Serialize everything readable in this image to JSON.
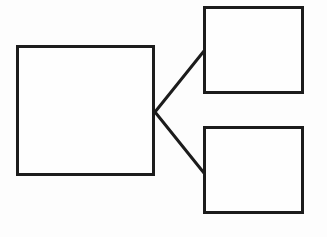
{
  "diagram": {
    "type": "tree",
    "stroke_color": "#1c1c1c",
    "background_color": "#ffffff",
    "nodes": [
      {
        "id": "root",
        "label": "",
        "x": 16,
        "y": 45,
        "width": 139,
        "height": 131
      },
      {
        "id": "child-top",
        "label": "",
        "x": 203,
        "y": 6,
        "width": 101,
        "height": 88
      },
      {
        "id": "child-bottom",
        "label": "",
        "x": 203,
        "y": 126,
        "width": 101,
        "height": 88
      }
    ],
    "edges": [
      {
        "from": "root",
        "to": "child-top",
        "x1": 155,
        "y1": 112,
        "x2": 204,
        "y2": 51
      },
      {
        "from": "root",
        "to": "child-bottom",
        "x1": 155,
        "y1": 112,
        "x2": 204,
        "y2": 173
      }
    ]
  }
}
